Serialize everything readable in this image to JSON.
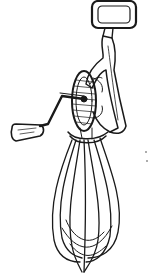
{
  "image": {
    "subject": "Antique hand-crank rotary egg beater (line drawing)",
    "style": "black ink line illustration on white",
    "colors": {
      "background": "#ffffff",
      "ink": "#1a1a1a"
    },
    "parts": [
      "loop-handle",
      "frame",
      "gear-wheel",
      "crank-arm",
      "wooden-knob",
      "whisk-loops"
    ]
  }
}
